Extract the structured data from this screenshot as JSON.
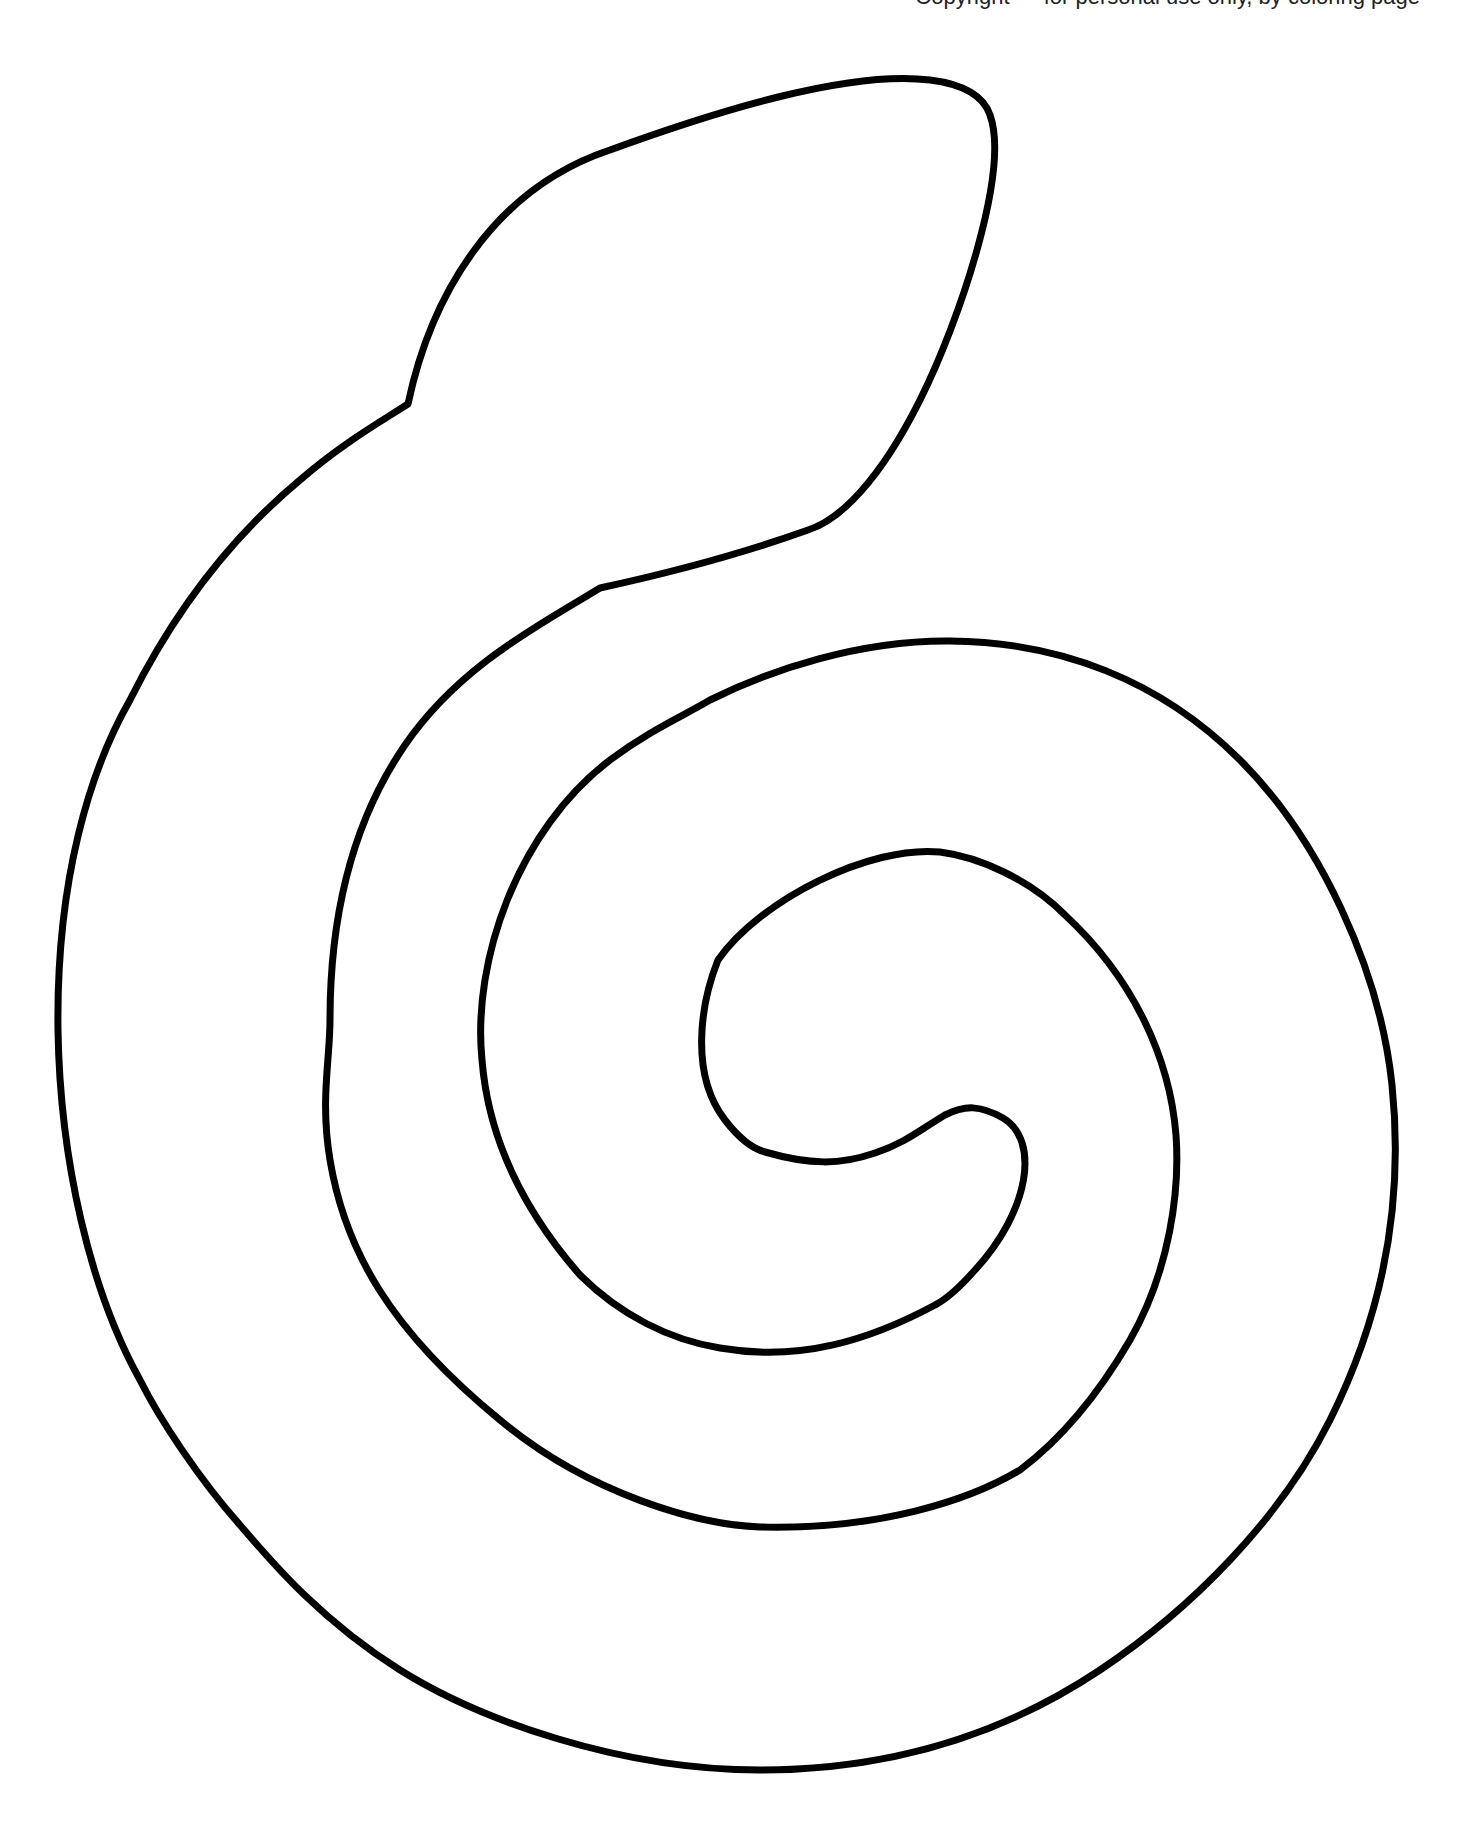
{
  "page": {
    "type": "coloring-page",
    "clipped_header_text": "Copyright — for personal use only, by coloring page"
  },
  "art": {
    "stroke_color": "#000000",
    "background_color": "#ffffff",
    "stroke_width": 7
  }
}
